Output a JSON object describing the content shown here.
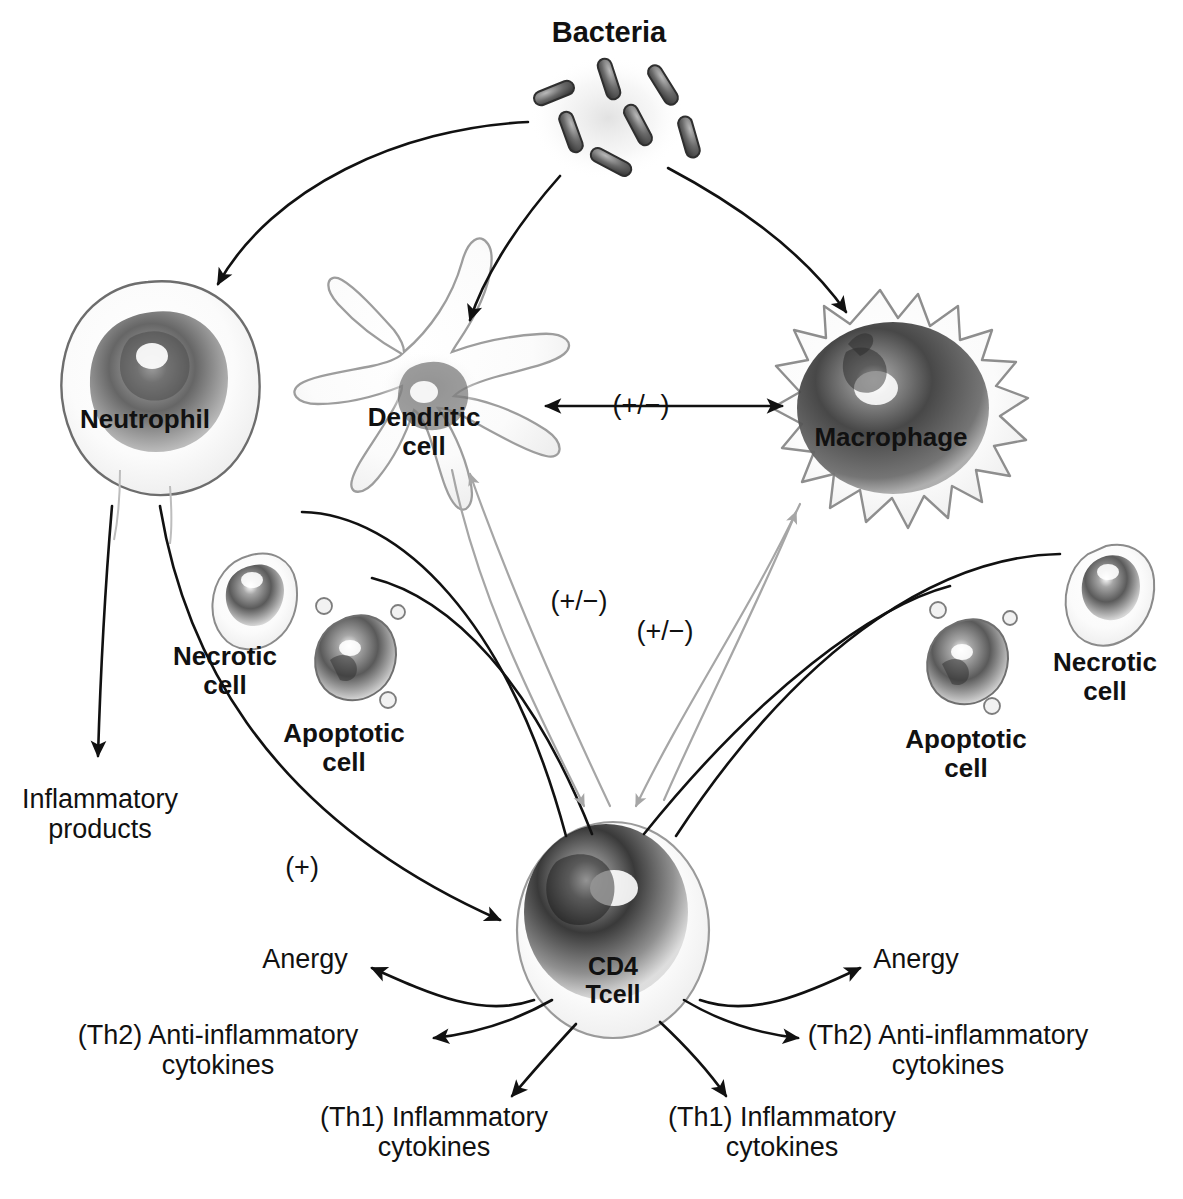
{
  "diagram": {
    "background_color": "#ffffff",
    "ink_color": "#111111",
    "faint_ink_color": "#9a9a9a",
    "cells": [
      {
        "id": "bacteria",
        "label": "Bacteria",
        "bold": true,
        "x": 609,
        "y": 16,
        "kind": "rods-cluster"
      },
      {
        "id": "neutrophil",
        "label": "Neutrophil",
        "bold": true,
        "x": 145,
        "y": 405,
        "kind": "round-cell"
      },
      {
        "id": "dendritic",
        "label": "Dendritic\ncell",
        "bold": true,
        "x": 424,
        "y": 403,
        "kind": "stellate-cell"
      },
      {
        "id": "macrophage",
        "label": "Macrophage",
        "bold": true,
        "x": 891,
        "y": 423,
        "kind": "spiky-cell"
      },
      {
        "id": "necrotic-left",
        "label": "Necrotic\ncell",
        "bold": true,
        "x": 225,
        "y": 642,
        "kind": "blob-cell"
      },
      {
        "id": "apoptotic-left",
        "label": "Apoptotic\ncell",
        "bold": true,
        "x": 344,
        "y": 719,
        "kind": "blebbing-cell"
      },
      {
        "id": "apoptotic-right",
        "label": "Apoptotic\ncell",
        "bold": true,
        "x": 966,
        "y": 725,
        "kind": "blebbing-cell"
      },
      {
        "id": "necrotic-right",
        "label": "Necrotic\ncell",
        "bold": true,
        "x": 1105,
        "y": 648,
        "kind": "blob-cell"
      },
      {
        "id": "cd4-tcell",
        "label": "CD4\nTcell",
        "bold": true,
        "x": 613,
        "y": 952,
        "kind": "oval-cell"
      }
    ],
    "sign_labels": [
      {
        "id": "sign-dc-mac",
        "text": "(+/−)",
        "x": 641,
        "y": 390
      },
      {
        "id": "sign-dc-tcell",
        "text": "(+/−)",
        "x": 579,
        "y": 586
      },
      {
        "id": "sign-mac-tcell",
        "text": "(+/−)",
        "x": 665,
        "y": 616
      },
      {
        "id": "sign-neut-plus",
        "text": "(+)",
        "x": 302,
        "y": 852
      }
    ],
    "outputs": [
      {
        "id": "inflammatory-products",
        "text": "Inflammatory\nproducts",
        "x": 100,
        "y": 784,
        "align": "center"
      },
      {
        "id": "anergy-left",
        "text": "Anergy",
        "x": 305,
        "y": 944,
        "align": "center"
      },
      {
        "id": "th2-left",
        "text": "(Th2) Anti-inflammatory\ncytokines",
        "x": 218,
        "y": 1020,
        "align": "center"
      },
      {
        "id": "th1-left",
        "text": "(Th1) Inflammatory\ncytokines",
        "x": 434,
        "y": 1102,
        "align": "center"
      },
      {
        "id": "th1-right",
        "text": "(Th1) Inflammatory\ncytokines",
        "x": 782,
        "y": 1102,
        "align": "center"
      },
      {
        "id": "th2-right",
        "text": "(Th2) Anti-inflammatory\ncytokines",
        "x": 948,
        "y": 1020,
        "align": "center"
      },
      {
        "id": "anergy-right",
        "text": "Anergy",
        "x": 916,
        "y": 944,
        "align": "center"
      }
    ],
    "arrows": [
      {
        "id": "arrow-bacteria-to-neutrophil",
        "from": "bacteria",
        "to": "neutrophil",
        "style": "solid-black",
        "head": "single"
      },
      {
        "id": "arrow-bacteria-to-dendritic",
        "from": "bacteria",
        "to": "dendritic",
        "style": "solid-black",
        "head": "single"
      },
      {
        "id": "arrow-bacteria-to-macrophage",
        "from": "bacteria",
        "to": "macrophage",
        "style": "solid-black",
        "head": "single"
      },
      {
        "id": "arrow-dendritic-macrophage",
        "from": "dendritic",
        "to": "macrophage",
        "style": "solid-black",
        "head": "double",
        "sign": "(+/−)"
      },
      {
        "id": "arrow-neutrophil-products",
        "from": "neutrophil",
        "to": "inflammatory-products",
        "style": "solid-black",
        "head": "single"
      },
      {
        "id": "arrow-neutrophil-tcell",
        "from": "neutrophil",
        "to": "cd4-tcell",
        "style": "solid-black",
        "head": "single",
        "sign": "(+)"
      },
      {
        "id": "arrow-necrotic-left-tcell",
        "from": "necrotic-left",
        "to": "cd4-tcell",
        "style": "solid-black",
        "head": "none"
      },
      {
        "id": "arrow-apoptotic-left-tcell",
        "from": "apoptotic-left",
        "to": "cd4-tcell",
        "style": "solid-black",
        "head": "none"
      },
      {
        "id": "arrow-necrotic-right-tcell",
        "from": "necrotic-right",
        "to": "cd4-tcell",
        "style": "solid-black",
        "head": "none"
      },
      {
        "id": "arrow-apoptotic-right-tcell",
        "from": "apoptotic-right",
        "to": "cd4-tcell",
        "style": "solid-black",
        "head": "none"
      },
      {
        "id": "arrow-dendritic-to-tcell",
        "from": "dendritic",
        "to": "cd4-tcell",
        "style": "faint-gray",
        "head": "single"
      },
      {
        "id": "arrow-tcell-to-dendritic",
        "from": "cd4-tcell",
        "to": "dendritic",
        "style": "faint-gray",
        "head": "single"
      },
      {
        "id": "arrow-macrophage-to-tcell",
        "from": "macrophage",
        "to": "cd4-tcell",
        "style": "faint-gray",
        "head": "single"
      },
      {
        "id": "arrow-tcell-to-macrophage",
        "from": "cd4-tcell",
        "to": "macrophage",
        "style": "faint-gray",
        "head": "single"
      },
      {
        "id": "arrow-tcell-anergy-left",
        "from": "cd4-tcell",
        "to": "anergy-left",
        "style": "solid-black",
        "head": "single"
      },
      {
        "id": "arrow-tcell-th2-left",
        "from": "cd4-tcell",
        "to": "th2-left",
        "style": "solid-black",
        "head": "single"
      },
      {
        "id": "arrow-tcell-th1-left",
        "from": "cd4-tcell",
        "to": "th1-left",
        "style": "solid-black",
        "head": "single"
      },
      {
        "id": "arrow-tcell-th1-right",
        "from": "cd4-tcell",
        "to": "th1-right",
        "style": "solid-black",
        "head": "single"
      },
      {
        "id": "arrow-tcell-th2-right",
        "from": "cd4-tcell",
        "to": "th2-right",
        "style": "solid-black",
        "head": "single"
      },
      {
        "id": "arrow-tcell-anergy-right",
        "from": "cd4-tcell",
        "to": "anergy-right",
        "style": "solid-black",
        "head": "single"
      }
    ]
  }
}
